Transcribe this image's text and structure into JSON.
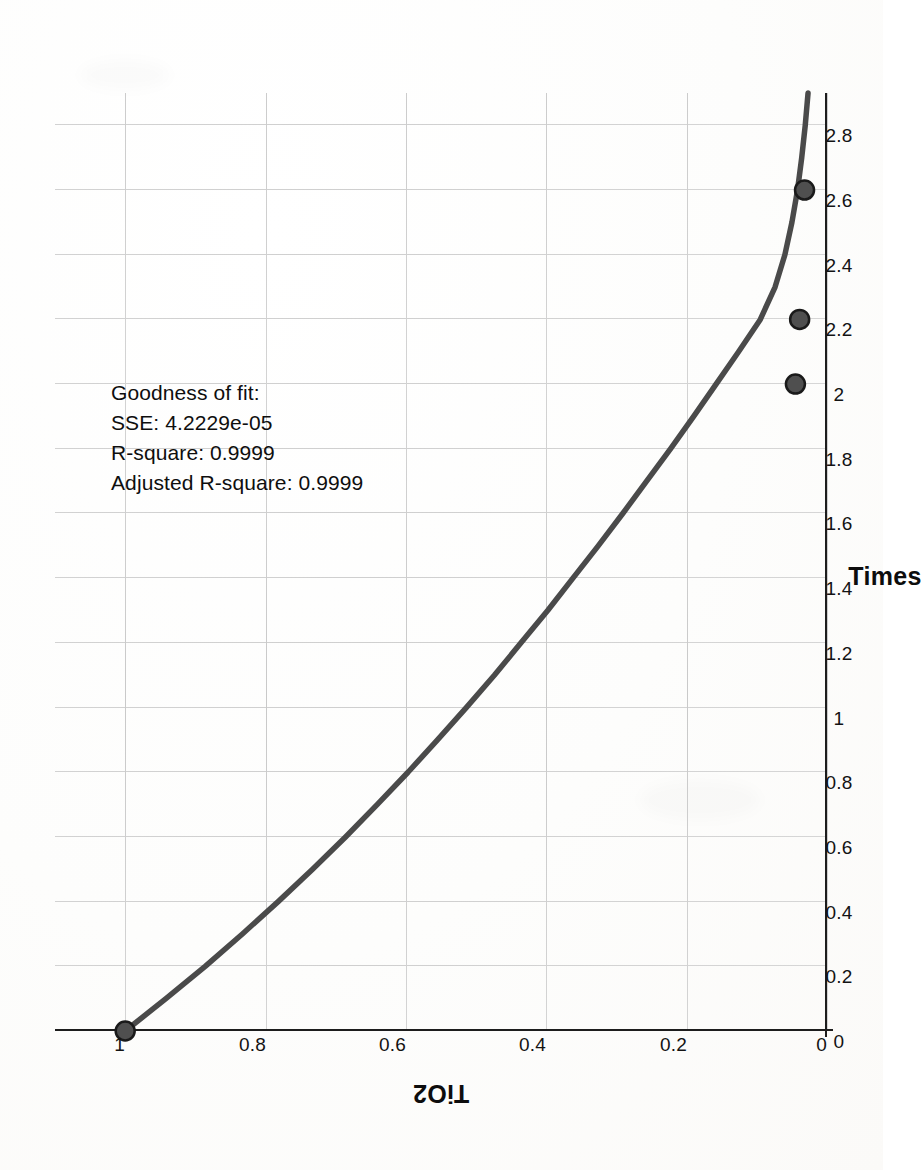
{
  "figure": {
    "kind": "curve-fit-plot",
    "page_orientation": "rotated-90-ccw",
    "line_color": "#4a4a4a",
    "marker_color": "#4f4f4f",
    "marker_edge_color": "#1a1a1a",
    "grid_color": "#cdcdcd",
    "axis_color": "#1d1d1d"
  },
  "annotation": {
    "line1": "Goodness of fit:",
    "line2": "SSE: 4.2229e-05",
    "line3": "R-square: 0.9999",
    "line4": "Adjusted R-square: 0.9999"
  },
  "chart_data": {
    "type": "line",
    "title": "",
    "subtitle": "",
    "xlabel": "Times",
    "ylabel": "TiO2",
    "xlim": [
      0,
      2.9
    ],
    "ylim": [
      0,
      1.1
    ],
    "grid": true,
    "legend": null,
    "xticks": [
      0,
      0.2,
      0.4,
      0.6,
      0.8,
      1,
      1.2,
      1.4,
      1.6,
      1.8,
      2,
      2.2,
      2.4,
      2.6,
      2.8
    ],
    "xticklabels": [
      "0",
      "0.2",
      "0.4",
      "0.6",
      "0.8",
      "1",
      "1.2",
      "1.4",
      "1.6",
      "1.8",
      "2",
      "2.2",
      "2.4",
      "2.6",
      "2.8"
    ],
    "yticks": [
      0,
      0.2,
      0.4,
      0.6,
      0.8,
      1
    ],
    "yticklabels": [
      "0",
      "0.2",
      "0.4",
      "0.6",
      "0.8",
      "1"
    ],
    "series": [
      {
        "name": "fitted curve",
        "style": "solid-line",
        "x": [
          0,
          0.1,
          0.2,
          0.3,
          0.4,
          0.5,
          0.6,
          0.7,
          0.8,
          0.9,
          1.0,
          1.1,
          1.2,
          1.3,
          1.4,
          1.5,
          1.6,
          1.7,
          1.8,
          1.9,
          2.0,
          2.1,
          2.2,
          2.3,
          2.4,
          2.5,
          2.6,
          2.7,
          2.8,
          2.9
        ],
        "y": [
          1.0,
          0.942,
          0.886,
          0.833,
          0.782,
          0.733,
          0.686,
          0.641,
          0.597,
          0.555,
          0.514,
          0.474,
          0.436,
          0.398,
          0.362,
          0.326,
          0.291,
          0.257,
          0.223,
          0.19,
          0.158,
          0.126,
          0.095,
          0.074,
          0.06,
          0.05,
          0.042,
          0.036,
          0.031,
          0.027
        ]
      },
      {
        "name": "data points",
        "style": "filled-circle-markers",
        "x": [
          0,
          2.0,
          2.2,
          2.6
        ],
        "y": [
          1.0,
          0.045,
          0.039,
          0.032
        ]
      }
    ],
    "annotations": [
      "Goodness of fit:",
      "SSE: 4.2229e-05",
      "R-square: 0.9999",
      "Adjusted R-square: 0.9999"
    ]
  }
}
